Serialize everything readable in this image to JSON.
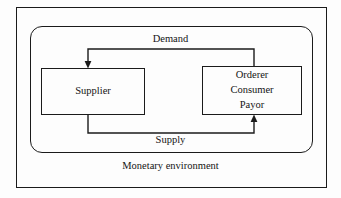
{
  "diagram": {
    "title": "Monetary environment",
    "outer_frame_name": "outer-frame",
    "container_label": "Monetary environment",
    "entities": [
      {
        "id": "supplier",
        "lines": [
          "Supplier"
        ]
      },
      {
        "id": "orderer",
        "lines": [
          "Orderer",
          "Consumer",
          "Payor"
        ]
      }
    ],
    "flows": [
      {
        "id": "demand",
        "label": "Demand",
        "from": "orderer",
        "to": "supplier",
        "direction": "right-to-left",
        "position": "top"
      },
      {
        "id": "supply",
        "label": "Supply",
        "from": "supplier",
        "to": "orderer",
        "direction": "left-to-right",
        "position": "bottom"
      }
    ],
    "colors": {
      "stroke": "#1b1b1b",
      "text": "#141414",
      "background": "#fdfdfd"
    }
  }
}
